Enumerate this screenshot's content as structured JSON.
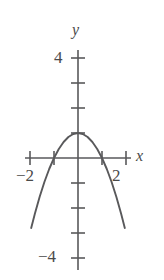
{
  "figure": {
    "background_color": "#ffffff",
    "stroke_color": "#59595b",
    "width": 164,
    "height": 280
  },
  "axes": {
    "x_name": "x",
    "y_name": "y",
    "origin_px": {
      "x": 78,
      "y": 158
    },
    "unit_px": {
      "x": 24,
      "y": 25
    },
    "x_axis_px": {
      "x1": 25,
      "x2": 131,
      "y": 158
    },
    "y_axis_px": {
      "y1": 50,
      "y2": 270,
      "x": 78
    },
    "x_ticks_units": [
      -2,
      -1,
      1,
      2
    ],
    "y_ticks_units": [
      4,
      3,
      2,
      1,
      -1,
      -2,
      -3,
      -4
    ],
    "tick_half_length_px": 5
  },
  "labels": {
    "y_top": "4",
    "y_bottom": "−4",
    "x_left": "−2",
    "x_right": "2"
  },
  "chart_data": {
    "type": "line",
    "title": "",
    "xlabel": "x",
    "ylabel": "y",
    "xlim": [
      -2.2,
      2.2
    ],
    "ylim": [
      -4.3,
      4.5
    ],
    "grid": false,
    "legend": null,
    "xticks": [
      -2,
      -1,
      0,
      1,
      2
    ],
    "xticklabels": [
      "−2",
      "",
      "",
      "",
      "2"
    ],
    "yticks": [
      -4,
      -3,
      -2,
      -1,
      0,
      1,
      2,
      3,
      4
    ],
    "yticklabels": [
      "−4",
      "",
      "",
      "",
      "",
      "",
      "",
      "",
      "4"
    ],
    "series": [
      {
        "name": "y = 1 − x²",
        "equation": "y = 1 - x^2",
        "vertex": [
          0,
          1
        ],
        "roots": [
          -1,
          1
        ],
        "opens": "down",
        "color": "#59595b",
        "x": [
          -1.95,
          -1.8,
          -1.6,
          -1.4,
          -1.2,
          -1.0,
          -0.8,
          -0.6,
          -0.4,
          -0.2,
          0.0,
          0.2,
          0.4,
          0.6,
          0.8,
          1.0,
          1.2,
          1.4,
          1.6,
          1.8,
          1.95
        ],
        "y": [
          -2.8,
          -2.24,
          -1.56,
          -0.96,
          -0.44,
          0.0,
          0.36,
          0.64,
          0.84,
          0.96,
          1.0,
          0.96,
          0.84,
          0.64,
          0.36,
          0.0,
          -0.44,
          -0.96,
          -1.56,
          -2.24,
          -2.8
        ]
      }
    ]
  }
}
